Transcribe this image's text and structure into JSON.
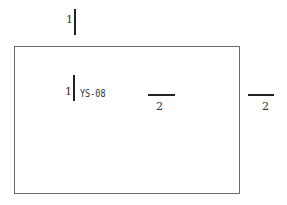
{
  "diagram": {
    "frame": {
      "stroke": "#6a6a6a"
    },
    "top_section_mark": {
      "number": "1"
    },
    "inner_section_mark": {
      "number": "1",
      "label": "YS-08"
    },
    "middle_section_mark": {
      "number": "2"
    },
    "right_section_mark": {
      "number": "2"
    },
    "line_color": "#222222"
  }
}
